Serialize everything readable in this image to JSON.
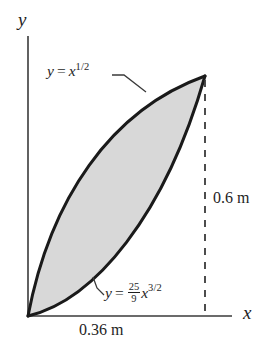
{
  "figure": {
    "type": "math-region-diagram",
    "background_color": "#ffffff",
    "fill_color": "#d8d8d8",
    "stroke_color": "#1a1a1a"
  },
  "axes": {
    "y_label": "y",
    "x_label": "x",
    "origin_px": [
      28,
      316
    ],
    "x_axis_end_px": [
      232,
      316
    ],
    "y_axis_top_px": [
      28,
      36
    ]
  },
  "curves": {
    "upper": {
      "label_prefix": "y",
      "equals": "=",
      "base": "x",
      "exponent": "1/2",
      "label_text": "y = x^1/2",
      "leader_from_px": [
        113,
        76
      ],
      "leader_to_px": [
        145,
        91
      ]
    },
    "lower": {
      "label_prefix": "y",
      "equals": "=",
      "coefficient_numerator": "25",
      "coefficient_denominator": "9",
      "base": "x",
      "exponent": "3/2",
      "label_text": "y = 25/9 x^3/2",
      "leader_from_px": [
        104,
        294
      ],
      "leader_to_px": [
        94,
        278
      ]
    }
  },
  "dimensions": {
    "height": "0.6 m",
    "width": "0.36 m",
    "dashed_line_x_px": 205,
    "dashed_line_top_px": 78,
    "dashed_line_bottom_px": 316
  },
  "geometry": {
    "apex_px": [
      205,
      76
    ],
    "origin_px": [
      28,
      316
    ],
    "upper_curve_path": "M 28 316 C 50 200 110 110 205 76",
    "lower_curve_path": "M 28 316 C 95 300 165 215 205 76"
  }
}
